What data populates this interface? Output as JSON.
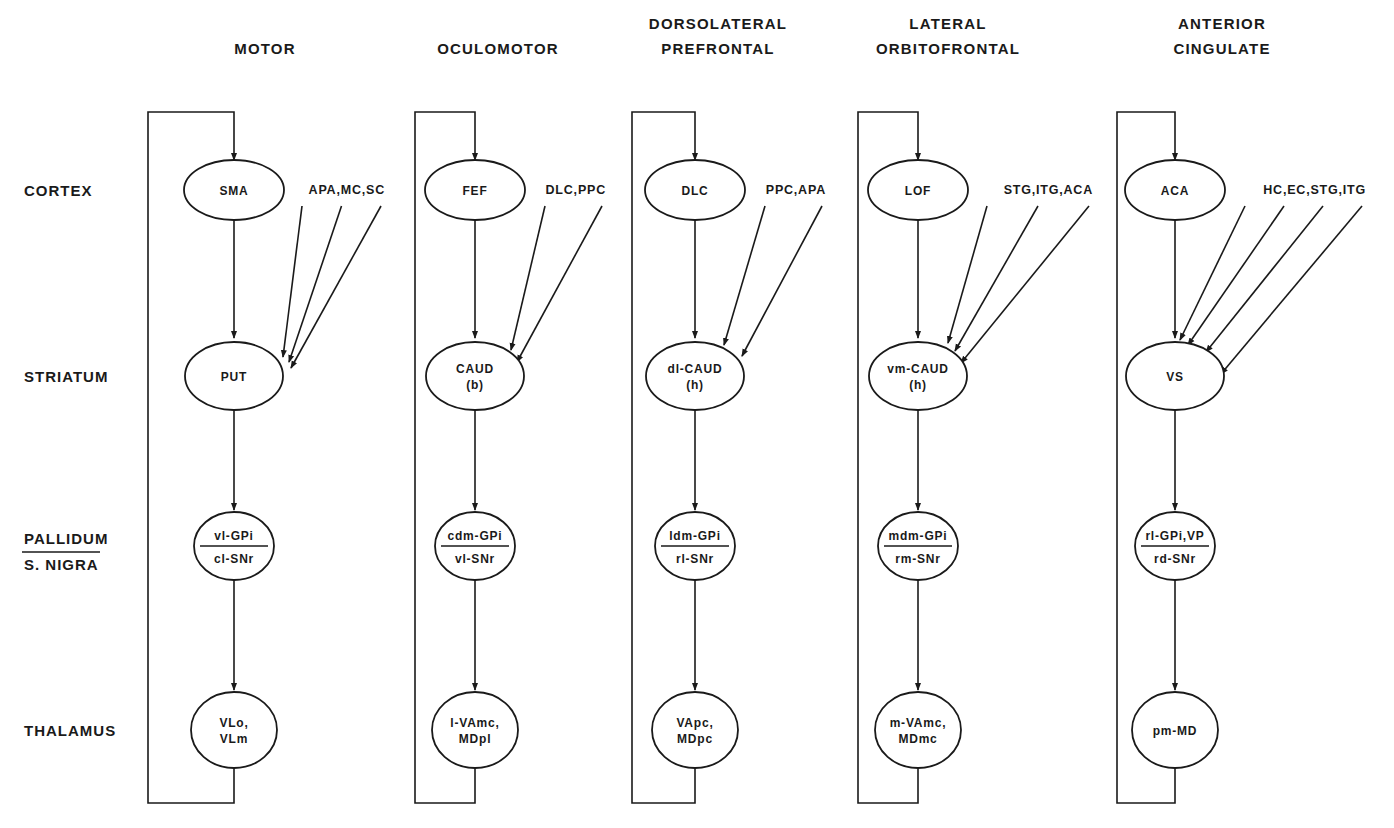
{
  "circuits": [
    {
      "name": "MOTOR",
      "header_lines": [
        "",
        "MOTOR"
      ],
      "cortex": "SMA",
      "cortical_inputs": "APA,MC,SC",
      "striatum": [
        "PUT"
      ],
      "pallidum": "vl-GPi",
      "nigra": "cl-SNr",
      "thalamus": [
        "VLo,",
        "VLm"
      ]
    },
    {
      "name": "OCULOMOTOR",
      "header_lines": [
        "",
        "OCULOMOTOR"
      ],
      "cortex": "FEF",
      "cortical_inputs": "DLC,PPC",
      "striatum": [
        "CAUD",
        "(b)"
      ],
      "pallidum": "cdm-GPi",
      "nigra": "vl-SNr",
      "thalamus": [
        "l-VAmc,",
        "MDpl"
      ]
    },
    {
      "name": "DORSOLATERAL PREFRONTAL",
      "header_lines": [
        "DORSOLATERAL",
        "PREFRONTAL"
      ],
      "cortex": "DLC",
      "cortical_inputs": "PPC,APA",
      "striatum": [
        "dl-CAUD",
        "(h)"
      ],
      "pallidum": "ldm-GPi",
      "nigra": "rl-SNr",
      "thalamus": [
        "VApc,",
        "MDpc"
      ]
    },
    {
      "name": "LATERAL ORBITOFRONTAL",
      "header_lines": [
        "LATERAL",
        "ORBITOFRONTAL"
      ],
      "cortex": "LOF",
      "cortical_inputs": "STG,ITG,ACA",
      "striatum": [
        "vm-CAUD",
        "(h)"
      ],
      "pallidum": "mdm-GPi",
      "nigra": "rm-SNr",
      "thalamus": [
        "m-VAmc,",
        "MDmc"
      ]
    },
    {
      "name": "ANTERIOR CINGULATE",
      "header_lines": [
        "ANTERIOR",
        "CINGULATE"
      ],
      "cortex": "ACA",
      "cortical_inputs": "HC,EC,STG,ITG",
      "striatum": [
        "VS"
      ],
      "pallidum": "rl-GPi,VP",
      "nigra": "rd-SNr",
      "thalamus": [
        "pm-MD"
      ]
    }
  ],
  "row_labels": {
    "cortex": "CORTEX",
    "striatum": "STRIATUM",
    "pallidum": "PALLIDUM",
    "nigra": "S. NIGRA",
    "thalamus": "THALAMUS"
  }
}
